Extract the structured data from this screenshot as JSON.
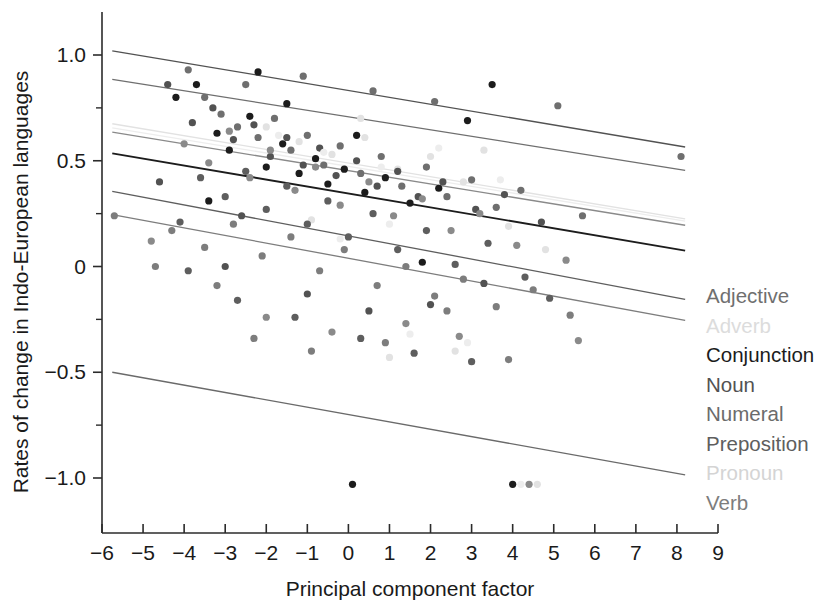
{
  "chart_data": {
    "type": "scatter",
    "title": "",
    "xlabel": "Principal component factor",
    "ylabel": "Rates of change in Indo-European languages",
    "xlim": [
      -6,
      9
    ],
    "ylim": [
      -1.15,
      1.18
    ],
    "grid": false,
    "legend_position": "right",
    "xticks": [
      -6,
      -5,
      -4,
      -3,
      -2,
      -1,
      0,
      1,
      2,
      3,
      4,
      5,
      6,
      7,
      8,
      9
    ],
    "xtick_labels": [
      "−6",
      "−5",
      "−4",
      "−3",
      "−2",
      "−1",
      "0",
      "1",
      "2",
      "3",
      "4",
      "5",
      "6",
      "7",
      "8",
      "9"
    ],
    "yticks": [
      1.0,
      0.5,
      0.0,
      -0.5,
      -1.0
    ],
    "ytick_labels": [
      "1.0",
      "0.5",
      "0",
      "−0.5",
      "−1.0"
    ],
    "yticks_minor": [
      0.75,
      0.25,
      -0.25,
      -0.75
    ],
    "series": [
      {
        "name": "Adjective",
        "color": "#6f6f6f",
        "legend_label": "Adjective",
        "fit": {
          "x0": -5.75,
          "y0": 0.885,
          "x1": 8.2,
          "y1": 0.455
        },
        "points": [
          [
            -3.9,
            0.93
          ],
          [
            -3.5,
            0.8
          ],
          [
            -3.1,
            0.72
          ],
          [
            -2.7,
            0.66
          ],
          [
            -2.2,
            0.61
          ],
          [
            -1.8,
            0.7
          ],
          [
            -1.4,
            0.55
          ],
          [
            -1.0,
            0.62
          ],
          [
            -0.6,
            0.48
          ],
          [
            -0.2,
            0.57
          ],
          [
            0.3,
            0.44
          ],
          [
            0.8,
            0.52
          ],
          [
            1.3,
            0.38
          ],
          [
            1.9,
            0.47
          ],
          [
            2.4,
            0.33
          ],
          [
            3.0,
            0.41
          ],
          [
            3.6,
            0.28
          ],
          [
            4.2,
            0.36
          ],
          [
            5.1,
            0.76
          ],
          [
            5.7,
            0.24
          ],
          [
            8.1,
            0.52
          ],
          [
            -2.5,
            0.86
          ],
          [
            -1.1,
            0.9
          ],
          [
            0.6,
            0.83
          ],
          [
            2.1,
            0.78
          ]
        ]
      },
      {
        "name": "Adverb",
        "color": "#e2e2e2",
        "legend_label": "Adverb",
        "fit": {
          "x0": -5.75,
          "y0": 0.675,
          "x1": 8.2,
          "y1": 0.225
        },
        "points": [
          [
            -2.0,
            0.66
          ],
          [
            -1.2,
            0.59
          ],
          [
            -0.4,
            0.53
          ],
          [
            0.4,
            0.61
          ],
          [
            1.2,
            0.46
          ],
          [
            2.0,
            0.52
          ],
          [
            2.8,
            0.4
          ],
          [
            3.3,
            0.55
          ],
          [
            2.6,
            -0.4
          ],
          [
            1.0,
            -0.43
          ],
          [
            4.6,
            -1.03
          ],
          [
            0.3,
            0.7
          ],
          [
            3.9,
            0.19
          ],
          [
            4.8,
            0.08
          ],
          [
            -0.9,
            0.22
          ]
        ]
      },
      {
        "name": "Conjunction",
        "color": "#1c1c1c",
        "legend_label": "Conjunction",
        "fit": {
          "x0": -5.75,
          "y0": 0.535,
          "x1": 8.2,
          "y1": 0.075
        },
        "points": [
          [
            -4.2,
            0.8
          ],
          [
            -3.7,
            0.86
          ],
          [
            -3.2,
            0.63
          ],
          [
            -2.9,
            0.55
          ],
          [
            -2.4,
            0.71
          ],
          [
            -2.0,
            0.47
          ],
          [
            -1.6,
            0.58
          ],
          [
            -1.2,
            0.44
          ],
          [
            -0.8,
            0.51
          ],
          [
            -0.5,
            0.39
          ],
          [
            -0.1,
            0.46
          ],
          [
            0.4,
            0.35
          ],
          [
            0.9,
            0.42
          ],
          [
            1.5,
            0.3
          ],
          [
            2.2,
            0.37
          ],
          [
            2.9,
            0.69
          ],
          [
            3.5,
            0.86
          ],
          [
            0.1,
            -1.03
          ],
          [
            4.0,
            -1.03
          ],
          [
            -2.2,
            0.92
          ],
          [
            -1.5,
            0.77
          ],
          [
            0.2,
            0.62
          ],
          [
            1.8,
            0.02
          ],
          [
            -3.4,
            0.31
          ]
        ]
      },
      {
        "name": "Noun",
        "color": "#525252",
        "legend_label": "Noun",
        "fit": {
          "x0": -5.75,
          "y0": 1.02,
          "x1": 8.2,
          "y1": 0.565
        },
        "points": [
          [
            -4.4,
            0.86
          ],
          [
            -3.8,
            0.68
          ],
          [
            -3.3,
            0.75
          ],
          [
            -2.8,
            0.6
          ],
          [
            -2.3,
            0.67
          ],
          [
            -1.9,
            0.52
          ],
          [
            -1.5,
            0.61
          ],
          [
            -1.1,
            0.48
          ],
          [
            -0.7,
            0.56
          ],
          [
            -0.3,
            0.43
          ],
          [
            0.2,
            0.5
          ],
          [
            0.7,
            0.38
          ],
          [
            1.2,
            0.45
          ],
          [
            1.7,
            0.33
          ],
          [
            2.3,
            0.4
          ],
          [
            3.1,
            0.27
          ],
          [
            3.8,
            0.34
          ],
          [
            4.7,
            0.21
          ],
          [
            -3.0,
            0.0
          ],
          [
            -1.0,
            -0.13
          ],
          [
            0.5,
            -0.21
          ],
          [
            2.0,
            -0.18
          ],
          [
            3.3,
            -0.08
          ],
          [
            -4.6,
            0.4
          ],
          [
            -2.6,
            0.24
          ]
        ]
      },
      {
        "name": "Numeral",
        "color": "#8a8a8a",
        "legend_label": "Numeral",
        "fit": {
          "x0": -5.75,
          "y0": 0.635,
          "x1": 8.2,
          "y1": 0.195
        },
        "points": [
          [
            -4.0,
            0.58
          ],
          [
            -3.4,
            0.49
          ],
          [
            -2.9,
            0.64
          ],
          [
            -2.4,
            0.42
          ],
          [
            -1.9,
            0.55
          ],
          [
            -1.3,
            0.36
          ],
          [
            -0.8,
            0.47
          ],
          [
            -0.2,
            0.29
          ],
          [
            0.5,
            0.4
          ],
          [
            1.1,
            0.24
          ],
          [
            1.8,
            0.32
          ],
          [
            2.5,
            0.17
          ],
          [
            3.2,
            0.25
          ],
          [
            4.1,
            0.1
          ],
          [
            5.3,
            0.03
          ],
          [
            -2.0,
            -0.24
          ],
          [
            -0.4,
            -0.31
          ],
          [
            1.4,
            -0.27
          ],
          [
            2.7,
            -0.33
          ],
          [
            5.6,
            -0.35
          ],
          [
            4.4,
            -1.03
          ],
          [
            -4.8,
            0.12
          ]
        ]
      },
      {
        "name": "Preposition",
        "color": "#5e5e5e",
        "legend_label": "Preposition",
        "fit": {
          "x0": -5.75,
          "y0": 0.355,
          "x1": 8.2,
          "y1": -0.155
        },
        "points": [
          [
            -3.6,
            0.42
          ],
          [
            -3.0,
            0.33
          ],
          [
            -2.5,
            0.45
          ],
          [
            -2.0,
            0.27
          ],
          [
            -1.5,
            0.38
          ],
          [
            -1.0,
            0.2
          ],
          [
            -0.5,
            0.31
          ],
          [
            0.0,
            0.14
          ],
          [
            0.6,
            0.25
          ],
          [
            1.2,
            0.08
          ],
          [
            1.9,
            0.17
          ],
          [
            2.6,
            0.01
          ],
          [
            3.4,
            0.11
          ],
          [
            4.3,
            -0.05
          ],
          [
            -4.1,
            0.21
          ],
          [
            -2.7,
            -0.16
          ],
          [
            -1.3,
            -0.24
          ],
          [
            0.3,
            -0.34
          ],
          [
            1.6,
            -0.41
          ],
          [
            3.0,
            -0.45
          ],
          [
            -3.9,
            -0.02
          ],
          [
            4.9,
            -0.15
          ]
        ]
      },
      {
        "name": "Pronoun",
        "color": "#ededed",
        "legend_label": "Pronoun",
        "fit": {
          "x0": -5.75,
          "y0": 0.655,
          "x1": 8.2,
          "y1": 0.215
        },
        "points": [
          [
            -1.7,
            0.62
          ],
          [
            -0.6,
            0.54
          ],
          [
            0.8,
            0.47
          ],
          [
            2.2,
            0.56
          ],
          [
            3.7,
            0.41
          ],
          [
            1.5,
            -0.32
          ],
          [
            2.9,
            -0.36
          ],
          [
            4.2,
            -1.03
          ],
          [
            -0.2,
            0.13
          ],
          [
            1.0,
            0.2
          ]
        ]
      },
      {
        "name": "Verb",
        "color": "#7d7d7d",
        "legend_label": "Verb",
        "fit": {
          "x0": -5.75,
          "y0": 0.245,
          "x1": 8.2,
          "y1": -0.255
        },
        "points": [
          [
            -5.7,
            0.24
          ],
          [
            -4.3,
            0.17
          ],
          [
            -3.5,
            0.09
          ],
          [
            -2.8,
            0.2
          ],
          [
            -2.1,
            0.05
          ],
          [
            -1.4,
            0.14
          ],
          [
            -0.7,
            -0.02
          ],
          [
            -0.1,
            0.08
          ],
          [
            0.7,
            -0.09
          ],
          [
            1.4,
            0.0
          ],
          [
            2.1,
            -0.14
          ],
          [
            2.8,
            -0.06
          ],
          [
            3.6,
            -0.19
          ],
          [
            4.5,
            -0.11
          ],
          [
            5.4,
            -0.23
          ],
          [
            -2.3,
            -0.34
          ],
          [
            -0.9,
            -0.4
          ],
          [
            0.9,
            -0.36
          ],
          [
            2.4,
            -0.21
          ],
          [
            -3.2,
            -0.09
          ],
          [
            -4.7,
            0.0
          ],
          [
            3.9,
            -0.44
          ]
        ]
      },
      {
        "name": "Lowest",
        "color": "#6a6a6a",
        "legend_label": "",
        "fit": {
          "x0": -5.75,
          "y0": -0.5,
          "x1": 8.2,
          "y1": -0.985
        },
        "points": []
      }
    ]
  },
  "legend": {
    "items": [
      {
        "label": "Adjective",
        "color": "#6f6f6f"
      },
      {
        "label": "Adverb",
        "color": "#dcdcdc"
      },
      {
        "label": "Conjunction",
        "color": "#1c1c1c"
      },
      {
        "label": "Noun",
        "color": "#525252"
      },
      {
        "label": "Numeral",
        "color": "#6b6b6b"
      },
      {
        "label": "Preposition",
        "color": "#5e5e5e"
      },
      {
        "label": "Pronoun",
        "color": "#d4d4d4"
      },
      {
        "label": "Verb",
        "color": "#7d7d7d"
      }
    ]
  }
}
